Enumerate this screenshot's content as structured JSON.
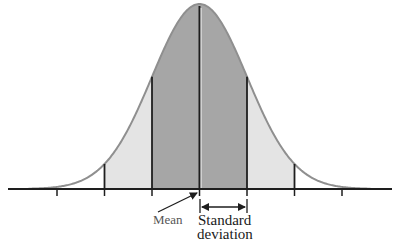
{
  "diagram": {
    "type": "normal-distribution",
    "labels": {
      "mean": "Mean",
      "sd_line1": "Standard",
      "sd_line2": "deviation"
    },
    "colors": {
      "inner_fill": "#a6a6a6",
      "outer_fill": "#e4e4e4",
      "curve": "#8f8f8f",
      "lines": "#1e1e1e",
      "background": "#ffffff"
    },
    "geometry": {
      "mean_x": 199.5,
      "sigma_px": 47.5,
      "baseline_y": 189,
      "peak_y": 4,
      "axis_x_start": 8,
      "axis_x_end": 392
    },
    "shaded_regions": [
      {
        "from_sigma": -2,
        "to_sigma": -1,
        "shade": "light"
      },
      {
        "from_sigma": -1,
        "to_sigma": 1,
        "shade": "dark"
      },
      {
        "from_sigma": 1,
        "to_sigma": 2,
        "shade": "light"
      }
    ],
    "tick_sigmas": [
      -3,
      -2,
      -1,
      0,
      1,
      2,
      3
    ],
    "vertical_line_sigmas": [
      -2,
      -1,
      0,
      1,
      2
    ]
  }
}
